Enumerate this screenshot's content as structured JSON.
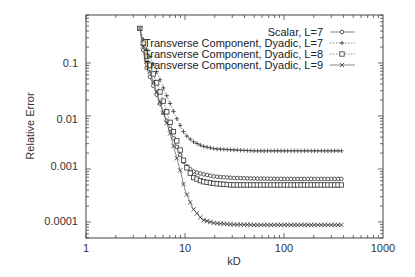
{
  "chart_data": {
    "type": "line",
    "title": "",
    "xlabel": "kD",
    "ylabel": "Relative Error",
    "xscale": "log",
    "yscale": "log",
    "xlim": [
      1,
      1000
    ],
    "ylim": [
      5e-05,
      0.45
    ],
    "xticks": [
      "1",
      "10",
      "100",
      "1000"
    ],
    "yticks": [
      "0.1",
      "0.01",
      "0.001",
      "0.0001"
    ],
    "grid": false,
    "legend_position": "top-right",
    "series": [
      {
        "name": "Scalar, L=7",
        "marker": "circle",
        "line": "solid",
        "x": [
          3.5,
          4,
          5,
          6,
          7,
          8,
          9,
          10,
          12,
          15,
          20,
          30,
          50,
          100,
          200,
          380
        ],
        "values": [
          0.45,
          0.09,
          0.03,
          0.012,
          0.006,
          0.003,
          0.0018,
          0.0012,
          0.0009,
          0.0008,
          0.00072,
          0.00068,
          0.00066,
          0.00065,
          0.00065,
          0.00065
        ]
      },
      {
        "name": "Transverse Component, Dyadic, L=7",
        "marker": "plus",
        "line": "dotted",
        "x": [
          3.5,
          4,
          5,
          6,
          7,
          8,
          9,
          10,
          12,
          15,
          20,
          30,
          50,
          100,
          200,
          380
        ],
        "values": [
          0.45,
          0.2,
          0.08,
          0.035,
          0.018,
          0.01,
          0.0065,
          0.0045,
          0.0033,
          0.0027,
          0.0024,
          0.0023,
          0.0022,
          0.0022,
          0.0022,
          0.0022
        ]
      },
      {
        "name": "Transverse Component, Dyadic, L=8",
        "marker": "square",
        "line": "dotted",
        "x": [
          3.5,
          4,
          5,
          6,
          7,
          8,
          9,
          10,
          12,
          15,
          20,
          30,
          50,
          100,
          200,
          380
        ],
        "values": [
          0.45,
          0.15,
          0.05,
          0.02,
          0.008,
          0.004,
          0.0022,
          0.0012,
          0.0007,
          0.00058,
          0.00053,
          0.0005,
          0.0005,
          0.0005,
          0.0005,
          0.0005
        ]
      },
      {
        "name": "Transverse Component, Dyadic, L=9",
        "marker": "cross",
        "line": "solid",
        "x": [
          3.5,
          4,
          5,
          6,
          7,
          8,
          9,
          10,
          12,
          15,
          20,
          30,
          50,
          100,
          200,
          380
        ],
        "values": [
          0.45,
          0.12,
          0.035,
          0.012,
          0.005,
          0.002,
          0.0009,
          0.0004,
          0.00018,
          0.00011,
          9.5e-05,
          9e-05,
          8.8e-05,
          8.8e-05,
          8.8e-05,
          8.8e-05
        ]
      }
    ]
  },
  "axes": {
    "xlabel": "kD",
    "ylabel": "Relative Error",
    "xticks": [
      "1",
      "10",
      "100",
      "1000"
    ],
    "yticks": [
      "0.1",
      "0.01",
      "0.001",
      "0.0001"
    ]
  },
  "legend": [
    "Scalar, L=7",
    "Transverse Component, Dyadic, L=7",
    "Transverse Component, Dyadic, L=8",
    "Transverse Component, Dyadic, L=9"
  ]
}
